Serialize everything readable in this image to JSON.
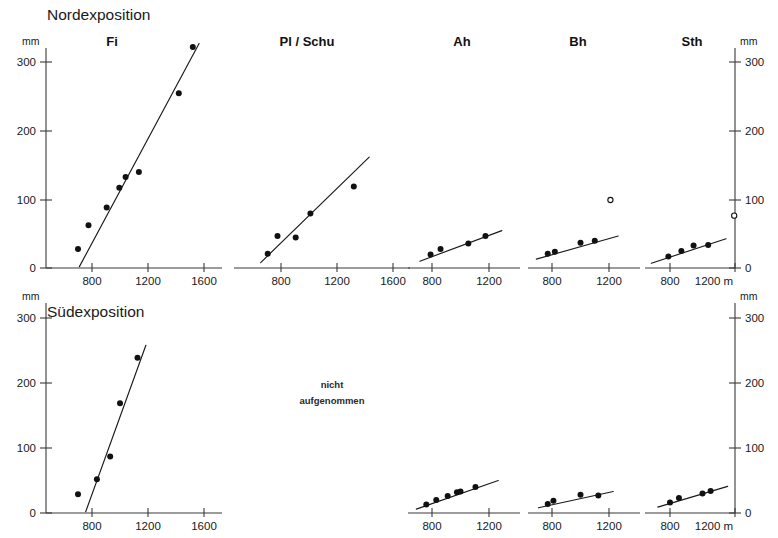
{
  "figure": {
    "row_titles": {
      "north": "Nordexposition",
      "south": "Südexposition"
    },
    "panel_titles": [
      "Fi",
      "Pl / Schu",
      "Ah",
      "Bh",
      "Sth"
    ],
    "unit_y": "mm",
    "unit_x": "m",
    "x_axis_end_label": "1200 m",
    "note": {
      "line1": "nicht",
      "line2": "aufgenommen"
    },
    "colors": {
      "ink": "#111111",
      "axis": "#3a3a3a",
      "background": "#ffffff"
    }
  },
  "chart_data": [
    {
      "type": "scatter",
      "title": "Fi",
      "panel_id": "north-fi",
      "row": "Nordexposition",
      "xlabel": "m",
      "ylabel": "mm",
      "xlim": [
        650,
        1700
      ],
      "ylim": [
        0,
        330
      ],
      "xticks": [
        800,
        1200,
        1600
      ],
      "yticks": [
        0,
        100,
        200,
        300
      ],
      "grid": false,
      "series": [
        {
          "name": "Fi Nordexposition",
          "marker": "filled-circle",
          "points": [
            {
              "x": 700,
              "y": 28
            },
            {
              "x": 775,
              "y": 63
            },
            {
              "x": 905,
              "y": 89
            },
            {
              "x": 995,
              "y": 118
            },
            {
              "x": 1040,
              "y": 134
            },
            {
              "x": 1135,
              "y": 141
            },
            {
              "x": 1420,
              "y": 257
            },
            {
              "x": 1520,
              "y": 325
            }
          ]
        }
      ],
      "regression": {
        "x1": 710,
        "y1": 2,
        "x2": 1565,
        "y2": 330
      }
    },
    {
      "type": "scatter",
      "title": "Pl / Schu",
      "panel_id": "north-plschu",
      "row": "Nordexposition",
      "xlabel": "m",
      "ylabel": "mm",
      "xlim": [
        650,
        1700
      ],
      "ylim": [
        0,
        330
      ],
      "xticks": [
        800,
        1200,
        1600
      ],
      "yticks": [
        0,
        100,
        200,
        300
      ],
      "grid": false,
      "series": [
        {
          "name": "Pl / Schu Nordexposition",
          "marker": "filled-circle",
          "points": [
            {
              "x": 705,
              "y": 21
            },
            {
              "x": 775,
              "y": 47
            },
            {
              "x": 905,
              "y": 45
            },
            {
              "x": 1010,
              "y": 80
            },
            {
              "x": 1320,
              "y": 120
            }
          ]
        }
      ],
      "regression": {
        "x1": 655,
        "y1": 8,
        "x2": 1430,
        "y2": 163
      }
    },
    {
      "type": "scatter",
      "title": "Ah",
      "panel_id": "north-ah",
      "row": "Nordexposition",
      "xlabel": "m",
      "ylabel": "mm",
      "xlim": [
        680,
        1330
      ],
      "ylim": [
        0,
        330
      ],
      "xticks": [
        800,
        1200
      ],
      "yticks": [
        0,
        100,
        200,
        300
      ],
      "grid": false,
      "series": [
        {
          "name": "Ah Nordexposition",
          "marker": "filled-circle",
          "points": [
            {
              "x": 790,
              "y": 20
            },
            {
              "x": 860,
              "y": 28
            },
            {
              "x": 1055,
              "y": 36
            },
            {
              "x": 1175,
              "y": 47
            }
          ]
        }
      ],
      "regression": {
        "x1": 715,
        "y1": 10,
        "x2": 1290,
        "y2": 55
      }
    },
    {
      "type": "scatter",
      "title": "Bh",
      "panel_id": "north-bh",
      "row": "Nordexposition",
      "xlabel": "m",
      "ylabel": "mm",
      "xlim": [
        680,
        1330
      ],
      "ylim": [
        0,
        330
      ],
      "xticks": [
        800,
        1200
      ],
      "yticks": [
        0,
        100,
        200,
        300
      ],
      "grid": false,
      "series": [
        {
          "name": "Bh Nordexposition",
          "marker": "filled-circle",
          "points": [
            {
              "x": 770,
              "y": 21
            },
            {
              "x": 820,
              "y": 24
            },
            {
              "x": 1000,
              "y": 37
            },
            {
              "x": 1100,
              "y": 40
            }
          ]
        },
        {
          "name": "Bh Nordexposition outlier",
          "marker": "open-circle",
          "points": [
            {
              "x": 1210,
              "y": 100
            }
          ]
        }
      ],
      "regression": {
        "x1": 690,
        "y1": 13,
        "x2": 1265,
        "y2": 47
      }
    },
    {
      "type": "scatter",
      "title": "Sth",
      "panel_id": "north-sth",
      "row": "Nordexposition",
      "xlabel": "m",
      "ylabel": "mm",
      "xlim": [
        680,
        1250
      ],
      "ylim": [
        0,
        330
      ],
      "xticks": [
        800,
        1200
      ],
      "yticks": [
        0,
        100,
        200,
        300
      ],
      "grid": false,
      "series": [
        {
          "name": "Sth Nordexposition",
          "marker": "filled-circle",
          "points": [
            {
              "x": 790,
              "y": 17
            },
            {
              "x": 870,
              "y": 25
            },
            {
              "x": 945,
              "y": 33
            },
            {
              "x": 1035,
              "y": 34
            }
          ]
        },
        {
          "name": "Sth Nordexposition outlier",
          "marker": "open-circle",
          "points": [
            {
              "x": 1195,
              "y": 77
            }
          ]
        }
      ],
      "regression": {
        "x1": 685,
        "y1": 7,
        "x2": 1145,
        "y2": 43
      }
    },
    {
      "type": "scatter",
      "title": "Fi",
      "panel_id": "south-fi",
      "row": "Südexposition",
      "xlabel": "m",
      "ylabel": "mm",
      "xlim": [
        650,
        1700
      ],
      "ylim": [
        0,
        330
      ],
      "xticks": [
        800,
        1200,
        1600
      ],
      "yticks": [
        0,
        100,
        200,
        300
      ],
      "grid": false,
      "series": [
        {
          "name": "Fi Südexposition",
          "marker": "filled-circle",
          "points": [
            {
              "x": 700,
              "y": 29
            },
            {
              "x": 835,
              "y": 52
            },
            {
              "x": 930,
              "y": 87
            },
            {
              "x": 1000,
              "y": 169
            },
            {
              "x": 1125,
              "y": 239
            }
          ]
        }
      ],
      "regression": {
        "x1": 755,
        "y1": 2,
        "x2": 1185,
        "y2": 258
      }
    },
    {
      "type": "scatter",
      "title": "Ah",
      "panel_id": "south-ah",
      "row": "Südexposition",
      "xlabel": "m",
      "ylabel": "mm",
      "xlim": [
        680,
        1330
      ],
      "ylim": [
        0,
        330
      ],
      "xticks": [
        800,
        1200
      ],
      "yticks": [
        0,
        100,
        200,
        300
      ],
      "grid": false,
      "series": [
        {
          "name": "Ah Südexposition",
          "marker": "filled-circle",
          "points": [
            {
              "x": 760,
              "y": 13
            },
            {
              "x": 830,
              "y": 20
            },
            {
              "x": 910,
              "y": 26
            },
            {
              "x": 975,
              "y": 32
            },
            {
              "x": 1105,
              "y": 40
            }
          ]
        },
        {
          "name": "Ah Südexposition extra",
          "marker": "filled-circle",
          "points": [
            {
              "x": 1000,
              "y": 33
            }
          ]
        }
      ],
      "regression": {
        "x1": 690,
        "y1": 6,
        "x2": 1265,
        "y2": 50
      }
    },
    {
      "type": "scatter",
      "title": "Bh",
      "panel_id": "south-bh",
      "row": "Südexposition",
      "xlabel": "m",
      "ylabel": "mm",
      "xlim": [
        680,
        1330
      ],
      "ylim": [
        0,
        330
      ],
      "xticks": [
        800,
        1200
      ],
      "yticks": [
        0,
        100,
        200,
        300
      ],
      "grid": false,
      "series": [
        {
          "name": "Bh Südexposition",
          "marker": "filled-circle",
          "points": [
            {
              "x": 770,
              "y": 14
            },
            {
              "x": 810,
              "y": 19
            },
            {
              "x": 1000,
              "y": 28
            },
            {
              "x": 1125,
              "y": 27
            }
          ]
        }
      ],
      "regression": {
        "x1": 705,
        "y1": 8,
        "x2": 1230,
        "y2": 33
      }
    },
    {
      "type": "scatter",
      "title": "Sth",
      "panel_id": "south-sth",
      "row": "Südexposition",
      "xlabel": "m",
      "ylabel": "mm",
      "xlim": [
        680,
        1250
      ],
      "ylim": [
        0,
        330
      ],
      "xticks": [
        800,
        1200
      ],
      "yticks": [
        0,
        100,
        200,
        300
      ],
      "grid": false,
      "series": [
        {
          "name": "Sth Südexposition",
          "marker": "filled-circle",
          "points": [
            {
              "x": 800,
              "y": 16
            },
            {
              "x": 855,
              "y": 23
            },
            {
              "x": 1000,
              "y": 30
            },
            {
              "x": 1050,
              "y": 34
            }
          ]
        }
      ],
      "regression": {
        "x1": 725,
        "y1": 9,
        "x2": 1155,
        "y2": 41
      }
    }
  ],
  "axes": {
    "left_top": {
      "unit": "mm",
      "ticks": [
        "300",
        "200",
        "100",
        "0"
      ]
    },
    "right_top": {
      "unit": "mm",
      "ticks": [
        "300",
        "200",
        "100",
        "0"
      ],
      "x_end": "1200 m"
    },
    "left_bottom": {
      "unit": "mm",
      "ticks": [
        "300",
        "200",
        "100",
        "0"
      ]
    },
    "right_bottom": {
      "unit": "mm",
      "ticks": [
        "300",
        "200",
        "100",
        "0"
      ],
      "x_end": "1200 m"
    }
  }
}
